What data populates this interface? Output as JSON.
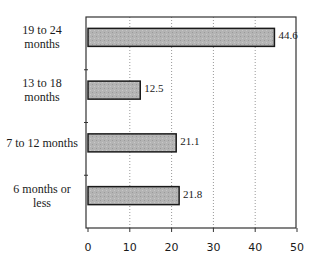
{
  "chart_data": {
    "type": "bar",
    "orientation": "horizontal",
    "title": "",
    "xlabel": "",
    "ylabel": "",
    "categories": [
      "19 to 24 months",
      "13 to 18 months",
      "7 to 12 months",
      "6 months or less"
    ],
    "category_labels_display": [
      [
        "19 to 24",
        "months"
      ],
      [
        "13 to 18",
        "months"
      ],
      [
        "7 to 12 months"
      ],
      [
        "6 months or",
        "less"
      ]
    ],
    "values": [
      44.6,
      12.5,
      21.1,
      21.8
    ],
    "value_labels": [
      "44.6",
      "12.5",
      "21.1",
      "21.8"
    ],
    "xlim": [
      0,
      50
    ],
    "xticks": [
      0,
      10,
      20,
      30,
      40,
      50
    ],
    "xtick_labels": [
      "0",
      "10",
      "20",
      "30",
      "40",
      "50"
    ],
    "grid": "vertical dotted",
    "legend": "none",
    "bar_color": "#b8b8b8",
    "bar_edge_color": "#1a1a1a"
  }
}
